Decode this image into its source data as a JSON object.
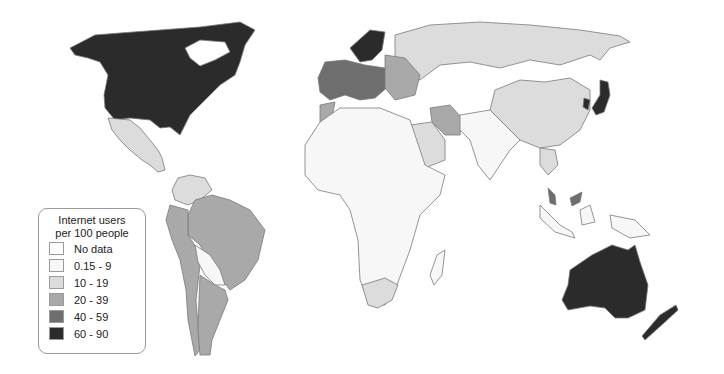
{
  "map": {
    "type": "choropleth",
    "projection": "world",
    "border_color": "#7a7a7a"
  },
  "legend": {
    "title_line1": "Internet users",
    "title_line2": "per 100 people",
    "items": [
      {
        "label": "No data",
        "color": "#ffffff"
      },
      {
        "label": "0.15 - 9",
        "color": "#f7f7f7"
      },
      {
        "label": "10 - 19",
        "color": "#dcdcdc"
      },
      {
        "label": "20 - 39",
        "color": "#a9a9a9"
      },
      {
        "label": "40 - 59",
        "color": "#6e6e6e"
      },
      {
        "label": "60 - 90",
        "color": "#2b2b2b"
      }
    ]
  },
  "regions": [
    {
      "name": "North America (US/Canada)",
      "class": "60 - 90"
    },
    {
      "name": "Mexico",
      "class": "10 - 19"
    },
    {
      "name": "Brazil",
      "class": "20 - 39"
    },
    {
      "name": "Argentina",
      "class": "20 - 39"
    },
    {
      "name": "Peru/Chile",
      "class": "20 - 39"
    },
    {
      "name": "Colombia/Venezuela",
      "class": "10 - 19"
    },
    {
      "name": "Bolivia/Paraguay",
      "class": "0.15 - 9"
    },
    {
      "name": "Western Europe",
      "class": "40 - 59"
    },
    {
      "name": "Scandinavia",
      "class": "60 - 90"
    },
    {
      "name": "Eastern Europe",
      "class": "20 - 39"
    },
    {
      "name": "Russia",
      "class": "10 - 19"
    },
    {
      "name": "China",
      "class": "10 - 19"
    },
    {
      "name": "Japan/South Korea",
      "class": "60 - 90"
    },
    {
      "name": "Iran",
      "class": "20 - 39"
    },
    {
      "name": "Saudi Arabia",
      "class": "10 - 19"
    },
    {
      "name": "Africa",
      "class": "0.15 - 9"
    },
    {
      "name": "South Africa",
      "class": "10 - 19"
    },
    {
      "name": "Morocco",
      "class": "20 - 39"
    },
    {
      "name": "India/SE Asia",
      "class": "0.15 - 9"
    },
    {
      "name": "Malaysia",
      "class": "40 - 59"
    },
    {
      "name": "Australia/New Zealand",
      "class": "60 - 90"
    },
    {
      "name": "Greenland",
      "class": "No data"
    }
  ]
}
